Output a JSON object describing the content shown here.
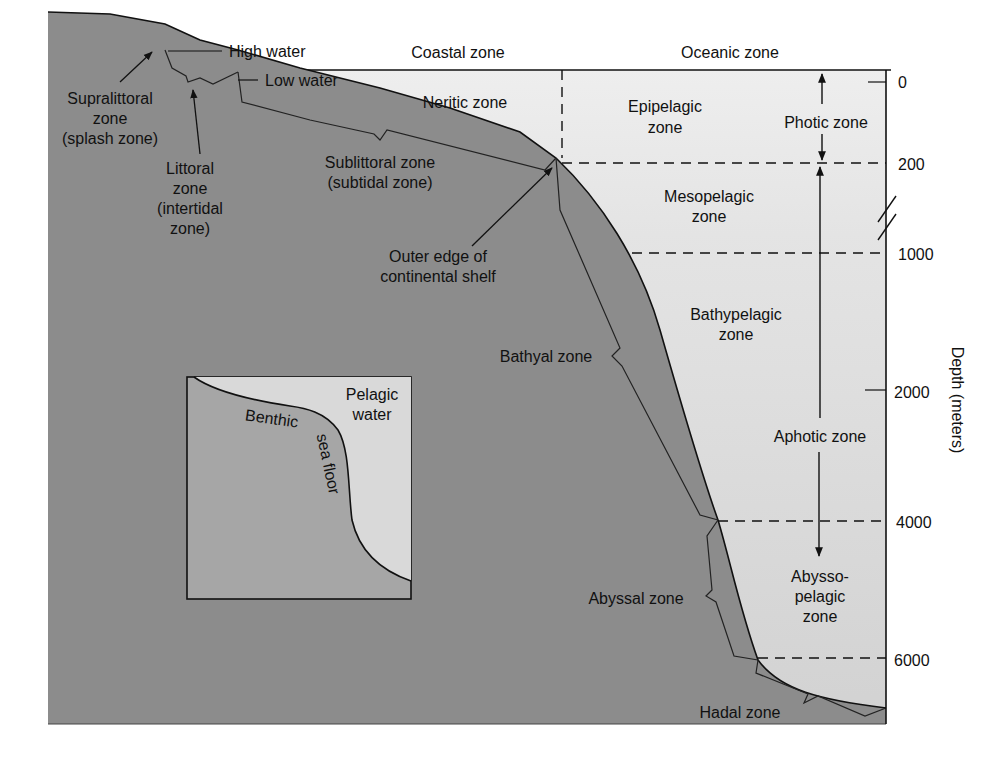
{
  "diagram": {
    "colors": {
      "seafloor": "#8c8c8c",
      "benthic_band": "#9a9a9a",
      "water_light": "#ececec",
      "water_mid": "#dedede",
      "water_deep": "#d2d2d2",
      "inset_floor": "#a6a6a6",
      "inset_water": "#d9d9d9",
      "ink": "#111111"
    },
    "headers": {
      "coastal": "Coastal zone",
      "oceanic": "Oceanic zone"
    },
    "shore_labels": {
      "high_water": "High water",
      "low_water": "Low water"
    },
    "benthic_zones": {
      "supralittoral": [
        "Supralittoral",
        "zone",
        "(splash zone)"
      ],
      "littoral": [
        "Littoral",
        "zone",
        "(intertidal",
        "zone)"
      ],
      "sublittoral": [
        "Sublittoral zone",
        "(subtidal zone)"
      ],
      "shelf_edge": [
        "Outer edge of",
        "continental shelf"
      ],
      "bathyal": "Bathyal zone",
      "abyssal": "Abyssal zone",
      "hadal": "Hadal zone"
    },
    "pelagic_zones": {
      "neritic": "Neritic zone",
      "epipelagic": [
        "Epipelagic",
        "zone"
      ],
      "mesopelagic": [
        "Mesopelagic",
        "zone"
      ],
      "bathypelagic": [
        "Bathypelagic",
        "zone"
      ],
      "abyssopelagic": [
        "Abysso-",
        "pelagic",
        "zone"
      ]
    },
    "light_zones": {
      "photic": "Photic zone",
      "aphotic": "Aphotic zone"
    },
    "depth_axis": {
      "label": "Depth (meters)",
      "ticks": [
        "0",
        "200",
        "1000",
        "2000",
        "4000",
        "6000"
      ]
    },
    "inset": {
      "pelagic": [
        "Pelagic",
        "water"
      ],
      "benthic": "Benthic",
      "sea_floor": "sea floor"
    }
  }
}
